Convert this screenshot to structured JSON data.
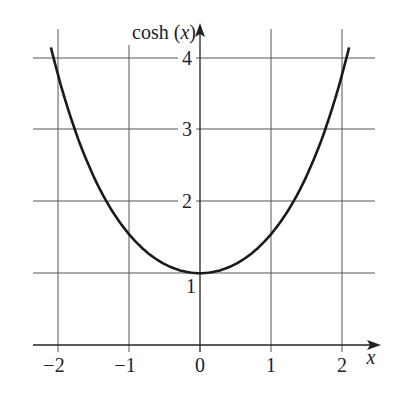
{
  "chart_data": {
    "type": "line",
    "title": "",
    "xlabel": "x",
    "ylabel": "cosh (x)",
    "ylabel_parts": {
      "fn": "cosh (",
      "var": "x",
      "close": ")"
    },
    "x_ticks": [
      "−2",
      "−1",
      "0",
      "1",
      "2"
    ],
    "y_ticks": [
      "1",
      "2",
      "3",
      "4"
    ],
    "xlim": [
      -2.35,
      2.55
    ],
    "ylim": [
      0,
      4.5
    ],
    "grid": true,
    "legend": null,
    "series": [
      {
        "name": "cosh(x)",
        "x": [
          -2.1,
          -2.0,
          -1.75,
          -1.5,
          -1.25,
          -1.0,
          -0.75,
          -0.5,
          -0.25,
          0,
          0.25,
          0.5,
          0.75,
          1.0,
          1.25,
          1.5,
          1.75,
          2.0,
          2.1
        ],
        "values": [
          4.14,
          3.76,
          2.96,
          2.35,
          1.89,
          1.54,
          1.29,
          1.13,
          1.03,
          1.0,
          1.03,
          1.13,
          1.29,
          1.54,
          1.89,
          2.35,
          2.96,
          3.76,
          4.14
        ]
      }
    ]
  },
  "colors": {
    "curve": "#1a1a1a",
    "grid": "#555555",
    "background": "#ffffff"
  }
}
